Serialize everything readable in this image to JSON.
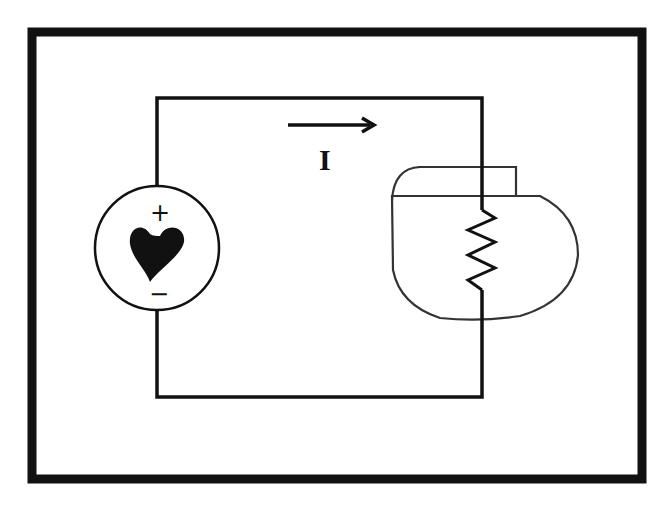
{
  "diagram": {
    "current_label": "I",
    "source": {
      "type": "heart voltage source",
      "plus_label": "+",
      "minus_label": "−"
    },
    "load": {
      "type": "resistor inside pacemaker outline"
    },
    "colors": {
      "stroke": "#111111",
      "background": "#ffffff",
      "outline": "#333333"
    }
  }
}
